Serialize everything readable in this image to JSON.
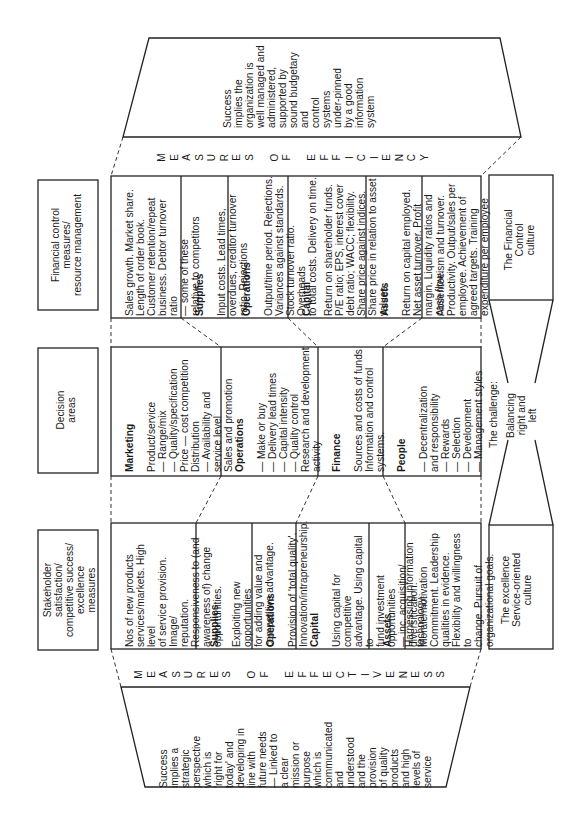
{
  "efficiency_band": {
    "success_text": "Success\nimplies the\norganization is\nwell managed and\nadministered,\nsupported by\nsound budgetary and\ncontrol\nsystems\nunder-pinned\nby a good\ninformation\nsystem",
    "label": "MEASURES OF EFFICIENCY"
  },
  "effectiveness_band": {
    "success_text": "Success\nimplies a\nstrategic\nperspective\nwhich is\n'right for\ntoday' and\ndeveloping in\nline with\nfuture needs\n— Linked to\n   a clear\n   mission or\n   purpose\n   which is\n   communicated\n   and\n   understood\n   and the\n   provision\n   of quality\n   products\n   and high\n   levels of\n   service",
    "label": "MEASURES OF EFFECTIVENESS"
  },
  "headers": {
    "financial": "Financial control\nmeasures/\nresource management",
    "decision": "Decision\nareas",
    "stakeholder": "Stakeholder\nsatisfaction/\ncompetitive success/\nexcellence\nmeasures"
  },
  "efficiency_cells": [
    {
      "title": "",
      "text": "Sales growth. Market share.\nLength of order book.\nCustomer retention/repeat\nbusiness. Debtor turnover ratio\n— some of these\n      relative to competitors"
    },
    {
      "title": "Supplies",
      "text": "Input costs. Lead times,\noverdues, creditor turnover\nratio. Rejections"
    },
    {
      "title": "Operations",
      "text": "Output/time period. Rejections.\nVariances against standards.\nStock turnover ratio. Overheads\nto total costs. Delivery on time."
    },
    {
      "title": "Capital",
      "text": "Return on shareholder funds.\nP/E ratio; EPS, interest cover\ndebt ratio; WACC; flexibility.\nShare price against indices.\nShare price in relation to asset\nvalues."
    },
    {
      "title": "Assets",
      "text": "Return on capital employed.\nNet asset turnover. Profit\nmargin. Liquidity ratios and\ncash flow."
    },
    {
      "title": "",
      "text": "Absenteeism and turnover.\nProductivity. Output/sales per\nemployee. Achievement of\nagreed targets. Training\nexpenditure per employee"
    }
  ],
  "decision_cells": [
    {
      "title": "Marketing",
      "text": "Product/service\n  — Range/mix\n  — Quality/specification\nPrice — cost competition\nDistribution\n  — Availability and\n      service level\nSales and promotion"
    },
    {
      "title": "Operations",
      "text": "— Make or buy\n— Delivery lead times\n— Capital intensity\n— Quality control\nResearch and development\nactivity"
    },
    {
      "title": "Finance",
      "text": "Sources and costs of funds\nInformation and control\nsystems."
    },
    {
      "title": "People",
      "text": "— Decentralization\n    and responsibility\n— Rewards\n— Selection\n— Development\n— Management styles"
    }
  ],
  "effectiveness_cells": [
    {
      "title": "",
      "text": "Nos of new products\nservices/markets. High level\nof service provision. Image/\nreputation.\nResponsiveness to (and\nawareness of) change\nopportunities."
    },
    {
      "title": "Supplies",
      "text": "Exploiting new opportunities\nfor adding value and\ncompetitive advantage."
    },
    {
      "title": "Operations",
      "text": "Provision of 'total quality'.\nInnovation/intrapreneurship."
    },
    {
      "title": "Capital",
      "text": "Using capital for competitive\nadvantage. Using capital to\nfund investment opportunities\n— inc. acquisition/\ndiversification."
    },
    {
      "title": "Assets",
      "text": "Harnessing information\ntechnology."
    },
    {
      "title": "",
      "text": "Morale/motivation\nCommitment. Leadership\nqualities in evidence.\nFlexibility and willingness to\nchange. Pursuit of\norganizational goals."
    }
  ],
  "culture": {
    "financial": "The Financial\nControl\nculture",
    "challenge": "The challenge:",
    "balancing": "Balancing\nright and\nleft",
    "service": "The excellence\nService-oriented\nculture"
  }
}
